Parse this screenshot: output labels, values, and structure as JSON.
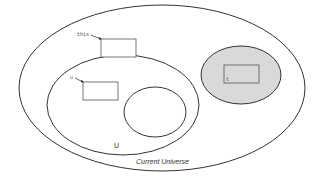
{
  "diagram": {
    "outer_universe": {
      "label": "Current Universe",
      "stroke": "#333333",
      "fill": "#ffffff"
    },
    "universe_u": {
      "label": "U",
      "stroke": "#333333",
      "fill": "#ffffff"
    },
    "inner_region": {
      "stroke": "#333333",
      "fill": "#ffffff"
    },
    "shaded_region": {
      "stroke": "#333333",
      "fill": "#d9d9d9"
    },
    "boxes": [
      {
        "pointer_label": "this"
      },
      {
        "pointer_label": "u"
      },
      {
        "inner_label": "t"
      }
    ]
  }
}
